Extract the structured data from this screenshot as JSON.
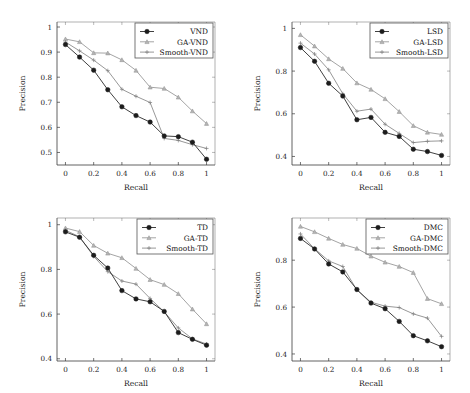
{
  "figure": {
    "title": "",
    "panel_count": 4
  },
  "chart_data": [
    {
      "type": "line",
      "panel": "top-left",
      "title": "",
      "xlabel": "Recall",
      "ylabel": "Precision",
      "xlim": [
        -0.06,
        1.06
      ],
      "ylim": [
        0.45,
        1.02
      ],
      "xticks": [
        0,
        0.2,
        0.4,
        0.6,
        0.8,
        1
      ],
      "xticklabels": [
        "0",
        "0.2",
        "0.4",
        "0.6",
        "0.8",
        "1"
      ],
      "yticks": [
        0.5,
        0.6,
        0.7,
        0.8,
        0.9,
        1
      ],
      "yticklabels": [
        "0.5",
        "0.6",
        "0.7",
        "0.8",
        "0.9",
        "1"
      ],
      "grid": false,
      "legend_position": "upper right",
      "x": [
        0,
        0.1,
        0.2,
        0.3,
        0.4,
        0.5,
        0.6,
        0.7,
        0.8,
        0.9,
        1
      ],
      "series": [
        {
          "name": "VND",
          "marker": "filled-circle",
          "color": "#1c1c1c",
          "values": [
            0.93,
            0.88,
            0.828,
            0.75,
            0.682,
            0.647,
            0.621,
            0.566,
            0.563,
            0.541,
            0.473
          ]
        },
        {
          "name": "GA-VND",
          "marker": "triangle",
          "color": "#b4b4b4",
          "values": [
            0.952,
            0.941,
            0.897,
            0.896,
            0.869,
            0.827,
            0.76,
            0.755,
            0.72,
            0.665,
            0.615
          ]
        },
        {
          "name": "Smooth-VND",
          "marker": "plus",
          "color": "#7d7d7d",
          "values": [
            0.94,
            0.905,
            0.868,
            0.826,
            0.752,
            0.724,
            0.699,
            0.556,
            0.548,
            0.531,
            0.516
          ]
        }
      ]
    },
    {
      "type": "line",
      "panel": "top-right",
      "title": "",
      "xlabel": "Recall",
      "ylabel": "Precision",
      "xlim": [
        -0.06,
        1.06
      ],
      "ylim": [
        0.36,
        1.03
      ],
      "xticks": [
        0,
        0.2,
        0.4,
        0.6,
        0.8,
        1
      ],
      "xticklabels": [
        "0",
        "0.2",
        "0.4",
        "0.6",
        "0.8",
        "1"
      ],
      "yticks": [
        0.4,
        0.6,
        0.8,
        1
      ],
      "yticklabels": [
        "0.4",
        "0.6",
        "0.8",
        "1"
      ],
      "grid": false,
      "legend_position": "upper right",
      "x": [
        0,
        0.1,
        0.2,
        0.3,
        0.4,
        0.5,
        0.6,
        0.7,
        0.8,
        0.9,
        1
      ],
      "series": [
        {
          "name": "LSD",
          "marker": "filled-circle",
          "color": "#1c1c1c",
          "values": [
            0.91,
            0.846,
            0.743,
            0.683,
            0.572,
            0.583,
            0.513,
            0.494,
            0.434,
            0.423,
            0.405
          ]
        },
        {
          "name": "GA-LSD",
          "marker": "triangle",
          "color": "#b4b4b4",
          "values": [
            0.97,
            0.917,
            0.857,
            0.812,
            0.744,
            0.714,
            0.67,
            0.61,
            0.544,
            0.513,
            0.503
          ]
        },
        {
          "name": "Smooth-LSD",
          "marker": "plus",
          "color": "#7d7d7d",
          "values": [
            0.931,
            0.88,
            0.806,
            0.694,
            0.612,
            0.622,
            0.551,
            0.508,
            0.465,
            0.471,
            0.473
          ]
        }
      ]
    },
    {
      "type": "line",
      "panel": "bottom-left",
      "title": "",
      "xlabel": "Recall",
      "ylabel": "Precision",
      "xlim": [
        -0.06,
        1.06
      ],
      "ylim": [
        0.39,
        1.03
      ],
      "xticks": [
        0,
        0.2,
        0.4,
        0.6,
        0.8,
        1
      ],
      "xticklabels": [
        "0",
        "0.2",
        "0.4",
        "0.6",
        "0.8",
        "1"
      ],
      "yticks": [
        0.4,
        0.6,
        0.8,
        1
      ],
      "yticklabels": [
        "0.4",
        "0.6",
        "0.8",
        "1"
      ],
      "grid": false,
      "legend_position": "upper right",
      "x": [
        0,
        0.1,
        0.2,
        0.3,
        0.4,
        0.5,
        0.6,
        0.7,
        0.8,
        0.9,
        1
      ],
      "series": [
        {
          "name": "TD",
          "marker": "filled-circle",
          "color": "#1c1c1c",
          "values": [
            0.968,
            0.944,
            0.863,
            0.806,
            0.705,
            0.668,
            0.655,
            0.612,
            0.517,
            0.487,
            0.461
          ]
        },
        {
          "name": "GA-TD",
          "marker": "triangle",
          "color": "#b4b4b4",
          "values": [
            0.985,
            0.969,
            0.907,
            0.872,
            0.852,
            0.804,
            0.754,
            0.732,
            0.691,
            0.622,
            0.556
          ]
        },
        {
          "name": "Smooth-TD",
          "marker": "plus",
          "color": "#7d7d7d",
          "values": [
            0.975,
            0.946,
            0.858,
            0.79,
            0.748,
            0.734,
            0.67,
            0.61,
            0.538,
            0.489,
            0.466
          ]
        }
      ]
    },
    {
      "type": "line",
      "panel": "bottom-right",
      "title": "",
      "xlabel": "Recall",
      "ylabel": "Precision",
      "xlim": [
        -0.06,
        1.06
      ],
      "ylim": [
        0.37,
        0.98
      ],
      "xticks": [
        0,
        0.2,
        0.4,
        0.6,
        0.8,
        1
      ],
      "xticklabels": [
        "0",
        "0.2",
        "0.4",
        "0.6",
        "0.8",
        "1"
      ],
      "yticks": [
        0.4,
        0.6,
        0.8
      ],
      "yticklabels": [
        "0.4",
        "0.6",
        "0.8"
      ],
      "grid": false,
      "legend_position": "upper right",
      "x": [
        0,
        0.1,
        0.2,
        0.3,
        0.4,
        0.5,
        0.6,
        0.7,
        0.8,
        0.9,
        1
      ],
      "series": [
        {
          "name": "DMC",
          "marker": "filled-circle",
          "color": "#1c1c1c",
          "values": [
            0.893,
            0.848,
            0.784,
            0.75,
            0.675,
            0.617,
            0.593,
            0.539,
            0.478,
            0.456,
            0.431
          ]
        },
        {
          "name": "GA-DMC",
          "marker": "triangle",
          "color": "#b4b4b4",
          "values": [
            0.944,
            0.921,
            0.893,
            0.867,
            0.85,
            0.817,
            0.791,
            0.773,
            0.747,
            0.636,
            0.614
          ]
        },
        {
          "name": "Smooth-DMC",
          "marker": "plus",
          "color": "#7d7d7d",
          "values": [
            0.912,
            0.849,
            0.797,
            0.773,
            0.673,
            0.621,
            0.604,
            0.598,
            0.571,
            0.553,
            0.475
          ]
        }
      ]
    }
  ]
}
